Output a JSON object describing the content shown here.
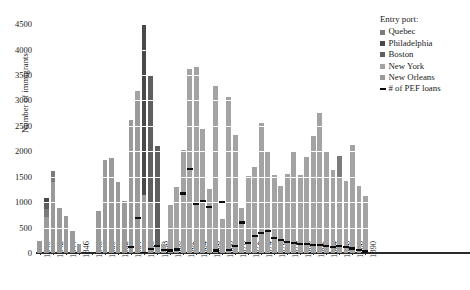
{
  "chart_data": {
    "type": "bar",
    "title": "",
    "xlabel": "",
    "ylabel": "Number of immigrants",
    "ylim": [
      0,
      4600
    ],
    "yticks": [
      0,
      500,
      1000,
      1500,
      2000,
      2500,
      3000,
      3500,
      4000,
      4500
    ],
    "grid": true,
    "stacked": true,
    "legend_position": "right",
    "legend_title": "Entry port:",
    "xlim": [
      1839.4,
      1891.0
    ],
    "xticks": [
      1840,
      1842,
      1844,
      1846,
      1848,
      1850,
      1852,
      1854,
      1856,
      1858,
      1860,
      1862,
      1864,
      1866,
      1868,
      1870,
      1872,
      1874,
      1876,
      1878,
      1880,
      1882,
      1884,
      1886,
      1888,
      1890
    ],
    "xtick_labels": [
      "1840",
      "1842",
      "1844",
      "1846",
      "1848",
      "1850",
      "1852",
      "1854",
      "1856",
      "1858",
      "1860",
      "1862",
      "1864",
      "1866",
      "1868",
      "1870",
      "1872",
      "1874",
      "1876",
      "1878",
      "1880",
      "1882",
      "1884",
      "1886",
      "1888",
      "1890"
    ],
    "series": [
      {
        "name": "Quebec",
        "color": "#7b7b7b"
      },
      {
        "name": "Philadelphia",
        "color": "#4a4a4a"
      },
      {
        "name": "Boston",
        "color": "#5f5f5f"
      },
      {
        "name": "New York",
        "color": "#a3a3a3"
      },
      {
        "name": "New Orleans",
        "color": "#9a9a9a"
      }
    ],
    "categories": [
      1840,
      1841,
      1842,
      1843,
      1844,
      1845,
      1846,
      1847,
      1848,
      1849,
      1850,
      1851,
      1852,
      1853,
      1854,
      1855,
      1856,
      1857,
      1858,
      1859,
      1860,
      1861,
      1862,
      1863,
      1864,
      1865,
      1866,
      1867,
      1868,
      1869,
      1870,
      1871,
      1872,
      1873,
      1874,
      1875,
      1876,
      1877,
      1878,
      1879,
      1880,
      1881,
      1882,
      1883,
      1884,
      1885,
      1886,
      1887,
      1888,
      1889,
      1890
    ],
    "values": [
      {
        "year": 1840,
        "total": 240,
        "segments": [
          {
            "name": "New Orleans",
            "value": 240
          }
        ]
      },
      {
        "year": 1841,
        "total": 1090,
        "segments": [
          {
            "name": "New Orleans",
            "value": 700
          },
          {
            "name": "Quebec",
            "value": 170
          },
          {
            "name": "Boston",
            "value": 120
          },
          {
            "name": "Philadelphia",
            "value": 100
          }
        ]
      },
      {
        "year": 1842,
        "total": 1620,
        "segments": [
          {
            "name": "New Orleans",
            "value": 1390
          },
          {
            "name": "Quebec",
            "value": 230
          }
        ]
      },
      {
        "year": 1843,
        "total": 880,
        "segments": [
          {
            "name": "New Orleans",
            "value": 880
          }
        ]
      },
      {
        "year": 1844,
        "total": 720,
        "segments": [
          {
            "name": "New Orleans",
            "value": 720
          }
        ]
      },
      {
        "year": 1845,
        "total": 440,
        "segments": [
          {
            "name": "New Orleans",
            "value": 440
          }
        ]
      },
      {
        "year": 1846,
        "total": 170,
        "segments": [
          {
            "name": "New Orleans",
            "value": 170
          }
        ]
      },
      {
        "year": 1847,
        "total": 0,
        "segments": []
      },
      {
        "year": 1848,
        "total": 0,
        "segments": []
      },
      {
        "year": 1849,
        "total": 820,
        "segments": [
          {
            "name": "New Orleans",
            "value": 820
          }
        ]
      },
      {
        "year": 1850,
        "total": 1830,
        "segments": [
          {
            "name": "New Orleans",
            "value": 1830
          }
        ]
      },
      {
        "year": 1851,
        "total": 1870,
        "segments": [
          {
            "name": "New Orleans",
            "value": 1870
          }
        ]
      },
      {
        "year": 1852,
        "total": 1390,
        "segments": [
          {
            "name": "New Orleans",
            "value": 1390
          }
        ]
      },
      {
        "year": 1853,
        "total": 1020,
        "segments": [
          {
            "name": "New Orleans",
            "value": 1020
          }
        ]
      },
      {
        "year": 1854,
        "total": 2620,
        "segments": [
          {
            "name": "New Orleans",
            "value": 2620
          }
        ]
      },
      {
        "year": 1855,
        "total": 3190,
        "segments": [
          {
            "name": "New Orleans",
            "value": 3000
          },
          {
            "name": "New York",
            "value": 190
          }
        ]
      },
      {
        "year": 1856,
        "total": 4500,
        "segments": [
          {
            "name": "New Orleans",
            "value": 1150
          },
          {
            "name": "Philadelphia",
            "value": 3350
          }
        ]
      },
      {
        "year": 1857,
        "total": 3490,
        "segments": [
          {
            "name": "New Orleans",
            "value": 1000
          },
          {
            "name": "Boston",
            "value": 2490
          }
        ]
      },
      {
        "year": 1858,
        "total": 2100,
        "segments": [
          {
            "name": "New Orleans",
            "value": 140
          },
          {
            "name": "Boston",
            "value": 1960
          }
        ]
      },
      {
        "year": 1859,
        "total": 170,
        "segments": [
          {
            "name": "New York",
            "value": 170
          }
        ]
      },
      {
        "year": 1860,
        "total": 950,
        "segments": [
          {
            "name": "New York",
            "value": 950
          }
        ]
      },
      {
        "year": 1861,
        "total": 1290,
        "segments": [
          {
            "name": "New York",
            "value": 1290
          }
        ]
      },
      {
        "year": 1862,
        "total": 2030,
        "segments": [
          {
            "name": "New York",
            "value": 2030
          }
        ]
      },
      {
        "year": 1863,
        "total": 3610,
        "segments": [
          {
            "name": "New York",
            "value": 3610
          }
        ]
      },
      {
        "year": 1864,
        "total": 3660,
        "segments": [
          {
            "name": "New York",
            "value": 3660
          }
        ]
      },
      {
        "year": 1865,
        "total": 2430,
        "segments": [
          {
            "name": "New York",
            "value": 2430
          }
        ]
      },
      {
        "year": 1866,
        "total": 1260,
        "segments": [
          {
            "name": "New York",
            "value": 1260
          }
        ]
      },
      {
        "year": 1867,
        "total": 3280,
        "segments": [
          {
            "name": "New York",
            "value": 3280
          }
        ]
      },
      {
        "year": 1868,
        "total": 660,
        "segments": [
          {
            "name": "New York",
            "value": 660
          }
        ]
      },
      {
        "year": 1869,
        "total": 3070,
        "segments": [
          {
            "name": "New York",
            "value": 3070
          }
        ]
      },
      {
        "year": 1870,
        "total": 2320,
        "segments": [
          {
            "name": "New York",
            "value": 2320
          }
        ]
      },
      {
        "year": 1871,
        "total": 890,
        "segments": [
          {
            "name": "New York",
            "value": 890
          }
        ]
      },
      {
        "year": 1872,
        "total": 1520,
        "segments": [
          {
            "name": "New York",
            "value": 1520
          }
        ]
      },
      {
        "year": 1873,
        "total": 1700,
        "segments": [
          {
            "name": "New York",
            "value": 1700
          }
        ]
      },
      {
        "year": 1874,
        "total": 2560,
        "segments": [
          {
            "name": "New York",
            "value": 2560
          }
        ]
      },
      {
        "year": 1875,
        "total": 2000,
        "segments": [
          {
            "name": "New York",
            "value": 2000
          }
        ]
      },
      {
        "year": 1876,
        "total": 1530,
        "segments": [
          {
            "name": "New York",
            "value": 1530
          }
        ]
      },
      {
        "year": 1877,
        "total": 1320,
        "segments": [
          {
            "name": "New York",
            "value": 1320
          }
        ]
      },
      {
        "year": 1878,
        "total": 1560,
        "segments": [
          {
            "name": "New York",
            "value": 1560
          }
        ]
      },
      {
        "year": 1879,
        "total": 1980,
        "segments": [
          {
            "name": "New York",
            "value": 1980
          }
        ]
      },
      {
        "year": 1880,
        "total": 1540,
        "segments": [
          {
            "name": "New York",
            "value": 1540
          }
        ]
      },
      {
        "year": 1881,
        "total": 1890,
        "segments": [
          {
            "name": "New York",
            "value": 1890
          }
        ]
      },
      {
        "year": 1882,
        "total": 2300,
        "segments": [
          {
            "name": "New York",
            "value": 2300
          }
        ]
      },
      {
        "year": 1883,
        "total": 2760,
        "segments": [
          {
            "name": "New York",
            "value": 2760
          }
        ]
      },
      {
        "year": 1884,
        "total": 2000,
        "segments": [
          {
            "name": "New York",
            "value": 2000
          }
        ]
      },
      {
        "year": 1885,
        "total": 1640,
        "segments": [
          {
            "name": "New York",
            "value": 1640
          }
        ]
      },
      {
        "year": 1886,
        "total": 1900,
        "segments": [
          {
            "name": "New York",
            "value": 1480
          },
          {
            "name": "Quebec",
            "value": 420
          }
        ]
      },
      {
        "year": 1887,
        "total": 1420,
        "segments": [
          {
            "name": "New York",
            "value": 1420
          }
        ]
      },
      {
        "year": 1888,
        "total": 2130,
        "segments": [
          {
            "name": "New York",
            "value": 2130
          }
        ]
      },
      {
        "year": 1889,
        "total": 1310,
        "segments": [
          {
            "name": "New York",
            "value": 1310
          }
        ]
      },
      {
        "year": 1890,
        "total": 1130,
        "segments": [
          {
            "name": "New York",
            "value": 1130
          }
        ]
      }
    ],
    "loan_line": {
      "name": "# of PEF loans",
      "color": "#0d0d0d",
      "points": [
        {
          "year": 1854,
          "value": 120
        },
        {
          "year": 1855,
          "value": 680
        },
        {
          "year": 1856,
          "value": 0
        },
        {
          "year": 1857,
          "value": 80
        },
        {
          "year": 1858,
          "value": 130
        },
        {
          "year": 1859,
          "value": 60
        },
        {
          "year": 1860,
          "value": 50
        },
        {
          "year": 1861,
          "value": 70
        },
        {
          "year": 1862,
          "value": 1170
        },
        {
          "year": 1863,
          "value": 1650
        },
        {
          "year": 1864,
          "value": 970
        },
        {
          "year": 1865,
          "value": 1030
        },
        {
          "year": 1866,
          "value": 900
        },
        {
          "year": 1867,
          "value": 50
        },
        {
          "year": 1868,
          "value": 1000
        },
        {
          "year": 1869,
          "value": 60
        },
        {
          "year": 1870,
          "value": 140
        },
        {
          "year": 1871,
          "value": 600
        },
        {
          "year": 1872,
          "value": 200
        },
        {
          "year": 1873,
          "value": 340
        },
        {
          "year": 1874,
          "value": 400
        },
        {
          "year": 1875,
          "value": 430
        },
        {
          "year": 1876,
          "value": 300
        },
        {
          "year": 1877,
          "value": 250
        },
        {
          "year": 1878,
          "value": 210
        },
        {
          "year": 1879,
          "value": 190
        },
        {
          "year": 1880,
          "value": 170
        },
        {
          "year": 1881,
          "value": 170
        },
        {
          "year": 1882,
          "value": 150
        },
        {
          "year": 1883,
          "value": 160
        },
        {
          "year": 1884,
          "value": 130
        },
        {
          "year": 1885,
          "value": 120
        },
        {
          "year": 1886,
          "value": 130
        },
        {
          "year": 1887,
          "value": 110
        },
        {
          "year": 1888,
          "value": 90
        },
        {
          "year": 1889,
          "value": 60
        },
        {
          "year": 1890,
          "value": 30
        }
      ]
    }
  },
  "legend": {
    "title": "Entry port:",
    "entries": [
      {
        "label": "Quebec",
        "color": "#7b7b7b",
        "type": "swatch"
      },
      {
        "label": "Philadelphia",
        "color": "#4a4a4a",
        "type": "swatch"
      },
      {
        "label": "Boston",
        "color": "#5f5f5f",
        "type": "swatch"
      },
      {
        "label": "New York",
        "color": "#a3a3a3",
        "type": "swatch"
      },
      {
        "label": "New Orleans",
        "color": "#9a9a9a",
        "type": "swatch"
      },
      {
        "label": "# of PEF loans",
        "color": "#0d0d0d",
        "type": "line"
      }
    ]
  },
  "axes": {
    "y_title": "Number of immigrants"
  }
}
